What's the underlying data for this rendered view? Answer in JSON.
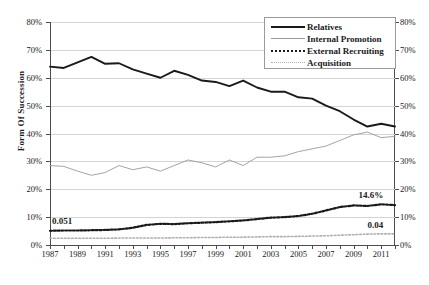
{
  "chart_data": {
    "type": "line",
    "title": "",
    "xlabel": "",
    "ylabel": "Form Of Succession",
    "ylim": [
      0,
      80
    ],
    "ytick_labels": [
      "0%",
      "10%",
      "20%",
      "30%",
      "40%",
      "50%",
      "60%",
      "70%",
      "80%"
    ],
    "ytick_values": [
      0,
      10,
      20,
      30,
      40,
      50,
      60,
      70,
      80
    ],
    "dual_axis": true,
    "right_ytick_labels": [
      "0%",
      "10%",
      "20%",
      "30%",
      "40%",
      "50%",
      "60%",
      "70%",
      "80%"
    ],
    "grid": true,
    "legend_position": "top-right",
    "x": [
      1987,
      1988,
      1989,
      1990,
      1991,
      1992,
      1993,
      1994,
      1995,
      1996,
      1997,
      1998,
      1999,
      2000,
      2001,
      2002,
      2003,
      2004,
      2005,
      2006,
      2007,
      2008,
      2009,
      2010,
      2011,
      2012
    ],
    "xtick_labels": [
      "1987",
      "1989",
      "1991",
      "1993",
      "1995",
      "1997",
      "1999",
      "2001",
      "2003",
      "2005",
      "2007",
      "2009",
      "2011"
    ],
    "series": [
      {
        "name": "Relatives",
        "style": "solid-thick",
        "color": "#1a1a1a",
        "values": [
          64.0,
          63.5,
          65.5,
          67.5,
          65.0,
          65.2,
          63.0,
          61.5,
          60.0,
          62.5,
          61.0,
          59.0,
          58.5,
          57.0,
          59.0,
          56.5,
          55.0,
          55.0,
          53.0,
          52.5,
          50.0,
          48.0,
          45.0,
          42.5,
          43.5,
          42.5
        ]
      },
      {
        "name": "Internal Promotion",
        "style": "solid-thin",
        "color": "#9a9a9a",
        "values": [
          28.5,
          28.2,
          26.5,
          25.0,
          26.0,
          28.5,
          27.0,
          28.0,
          26.5,
          28.5,
          30.5,
          29.5,
          28.0,
          30.5,
          28.5,
          31.5,
          31.5,
          32.0,
          33.5,
          34.5,
          35.5,
          37.5,
          39.5,
          40.5,
          38.5,
          39.0
        ]
      },
      {
        "name": "External Recruiting",
        "style": "dotted-bold",
        "color": "#1a1a1a",
        "values": [
          5.1,
          5.2,
          5.2,
          5.3,
          5.4,
          5.6,
          6.2,
          7.2,
          7.6,
          7.5,
          7.8,
          8.0,
          8.2,
          8.5,
          8.8,
          9.3,
          9.8,
          10.0,
          10.4,
          11.2,
          12.4,
          13.6,
          14.2,
          14.0,
          14.6,
          14.3
        ]
      },
      {
        "name": "Acquisition",
        "style": "dotted-light",
        "color": "#b0b0b0",
        "values": [
          2.4,
          2.4,
          2.4,
          2.4,
          2.4,
          2.5,
          2.5,
          2.5,
          2.5,
          2.6,
          2.6,
          2.7,
          2.7,
          2.8,
          2.8,
          2.9,
          3.0,
          3.0,
          3.1,
          3.2,
          3.3,
          3.5,
          3.7,
          3.9,
          4.0,
          4.0
        ]
      }
    ],
    "annotations": [
      {
        "text": "0.051",
        "series": "External Recruiting",
        "x": 1987,
        "y": 5.1
      },
      {
        "text": "14.6%",
        "series": "External Recruiting",
        "x": 2011,
        "y": 14.6
      },
      {
        "text": "0.04",
        "series": "Acquisition",
        "x": 2011,
        "y": 4.0
      }
    ]
  },
  "legend": {
    "items": [
      {
        "label": "Relatives"
      },
      {
        "label": "Internal Promotion"
      },
      {
        "label": "External Recruiting"
      },
      {
        "label": "Acquisition"
      }
    ]
  }
}
